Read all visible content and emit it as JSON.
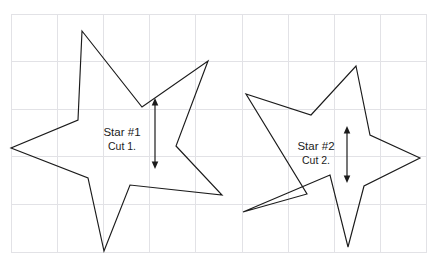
{
  "figure": {
    "background_color": "#ffffff",
    "ink_color": "#1b1b1b",
    "grid_color": "#e2e2e6",
    "width": 438,
    "height": 267
  },
  "grid": {
    "x_start": 11,
    "x_end": 427,
    "y_start": 14,
    "y_end": 252,
    "columns": 9,
    "rows": 5,
    "cell_width": 46.2,
    "cell_height": 47.6,
    "visible": true
  },
  "stars": [
    {
      "id": "star-1",
      "label": "Star #1",
      "sublabel": "Cut 1.",
      "label_x": 122,
      "label_y": 136,
      "sublabel_x": 122,
      "sublabel_y": 150,
      "points": "82,31 142,107 208,61 176,146 222,195 130,185 104,251 88,178 11,148 78,120",
      "outer_radius": 100,
      "inner_radius": 42,
      "num_points": 5
    },
    {
      "id": "star-2",
      "label": "Star #2",
      "sublabel": "Cut 2.",
      "label_x": 316,
      "label_y": 150,
      "sublabel_x": 316,
      "sublabel_y": 164,
      "points": "356,66 370,135 420,158 364,186 348,247 330,175 243,212 307,194 246,94 311,115",
      "outer_radius": 95,
      "inner_radius": 40,
      "num_points": 5
    }
  ],
  "dimensions": [
    {
      "id": "dimension-arrow-1",
      "name": "cut-1-height-arrow",
      "x": 155,
      "y_top": 98,
      "y_bottom": 169,
      "double_headed": true,
      "orientation": "vertical"
    },
    {
      "id": "dimension-arrow-2",
      "name": "cut-2-height-arrow",
      "x": 347,
      "y_top": 126,
      "y_bottom": 183,
      "double_headed": true,
      "orientation": "vertical"
    }
  ]
}
